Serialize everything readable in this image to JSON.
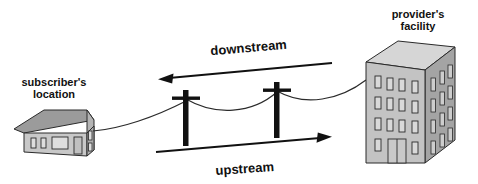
{
  "diagram": {
    "title_hidden": "",
    "labels": {
      "subscriber_line1": "subscriber's",
      "subscriber_line2": "location",
      "provider_line1": "provider's",
      "provider_line2": "facility",
      "downstream": "downstream",
      "upstream": "upstream"
    },
    "nodes": {
      "house": "subscriber-house",
      "office": "provider-building",
      "pole_left": "utility-pole-left",
      "pole_right": "utility-pole-right"
    },
    "colors": {
      "stroke": "#111111",
      "roof_fill": "#9a9a9a",
      "wall_fill": "#c9c9c9",
      "wall_side_fill": "#b0b0b0",
      "window_fill": "#d8d8d8",
      "building_front_fill": "#c2c2c2",
      "building_side_fill": "#a3a3a3",
      "building_top_fill": "#d5d5d5",
      "background": "#ffffff"
    },
    "arrows": [
      {
        "name": "downstream",
        "direction": "right-to-left",
        "label": "downstream"
      },
      {
        "name": "upstream",
        "direction": "left-to-right",
        "label": "upstream"
      }
    ]
  }
}
